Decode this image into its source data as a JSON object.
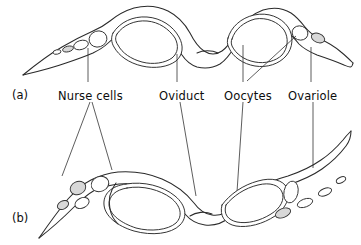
{
  "figure": {
    "background_color": "#ffffff",
    "line_color": "#2a2a2a",
    "shaded_cell_color": "#d8d8d8",
    "panels": [
      {
        "tag": "(a)",
        "description": "ovary with rounded oocyte chambers"
      },
      {
        "tag": "(b)",
        "description": "ovary with elongate oocyte chambers"
      }
    ],
    "labels": [
      {
        "id": "nurse-cells",
        "text": "Nurse cells",
        "x": 58,
        "y": 89
      },
      {
        "id": "oviduct",
        "text": "Oviduct",
        "x": 159,
        "y": 89
      },
      {
        "id": "oocytes",
        "text": "Oocytes",
        "x": 224,
        "y": 89
      },
      {
        "id": "ovariole",
        "text": "Ovariole",
        "x": 288,
        "y": 89
      }
    ]
  }
}
